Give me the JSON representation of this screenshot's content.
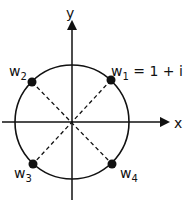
{
  "diagram": {
    "axes": {
      "x_label": "x",
      "y_label": "y"
    },
    "circle": {
      "center": "origin"
    },
    "points": [
      {
        "name": "w",
        "sub": "1",
        "extra": " = 1 + i",
        "quadrant": "I"
      },
      {
        "name": "w",
        "sub": "2",
        "extra": "",
        "quadrant": "II"
      },
      {
        "name": "w",
        "sub": "3",
        "extra": "",
        "quadrant": "III"
      },
      {
        "name": "w",
        "sub": "4",
        "extra": "",
        "quadrant": "IV"
      }
    ],
    "colors": {
      "stroke": "#111111",
      "background": "#ffffff"
    }
  }
}
